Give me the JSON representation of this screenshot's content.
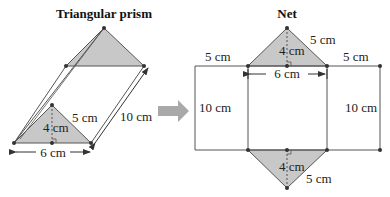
{
  "prism": {
    "title": "Triangular prism",
    "height_label": "4 cm",
    "slant_label": "5 cm",
    "base_label": "6 cm",
    "length_label": "10 cm"
  },
  "net": {
    "title": "Net",
    "top_triangle": {
      "height_label": "4 cm",
      "slant_label": "5 cm"
    },
    "base_label": "6 cm",
    "left_rect": {
      "width_label": "5 cm",
      "height_label": "10 cm"
    },
    "right_rect": {
      "width_label": "5 cm",
      "height_label": "10 cm"
    },
    "bottom_triangle": {
      "height_label": "4 cm",
      "slant_label": "5 cm"
    }
  },
  "arrow": {
    "direction": "right-arrow-icon"
  },
  "colors": {
    "fill": "#c8c8c8",
    "line": "#555555",
    "point": "#333333",
    "arrow": "#a9a9a9"
  }
}
